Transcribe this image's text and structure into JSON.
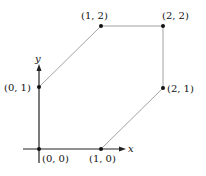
{
  "diagram": {
    "axes": {
      "x_label": "x",
      "y_label": "y"
    },
    "points": [
      {
        "label": "(0, 0)",
        "x": 0,
        "y": 0
      },
      {
        "label": "(1, 0)",
        "x": 1,
        "y": 0
      },
      {
        "label": "(2, 1)",
        "x": 2,
        "y": 1
      },
      {
        "label": "(2, 2)",
        "x": 2,
        "y": 2
      },
      {
        "label": "(1, 2)",
        "x": 1,
        "y": 2
      },
      {
        "label": "(0, 1)",
        "x": 0,
        "y": 1
      }
    ],
    "polygon_order": [
      "(0, 0)",
      "(1, 0)",
      "(2, 1)",
      "(2, 2)",
      "(1, 2)",
      "(0, 1)"
    ],
    "colors": {
      "axis": "#222222",
      "edge": "#8a8a8a",
      "point": "#111111"
    }
  }
}
